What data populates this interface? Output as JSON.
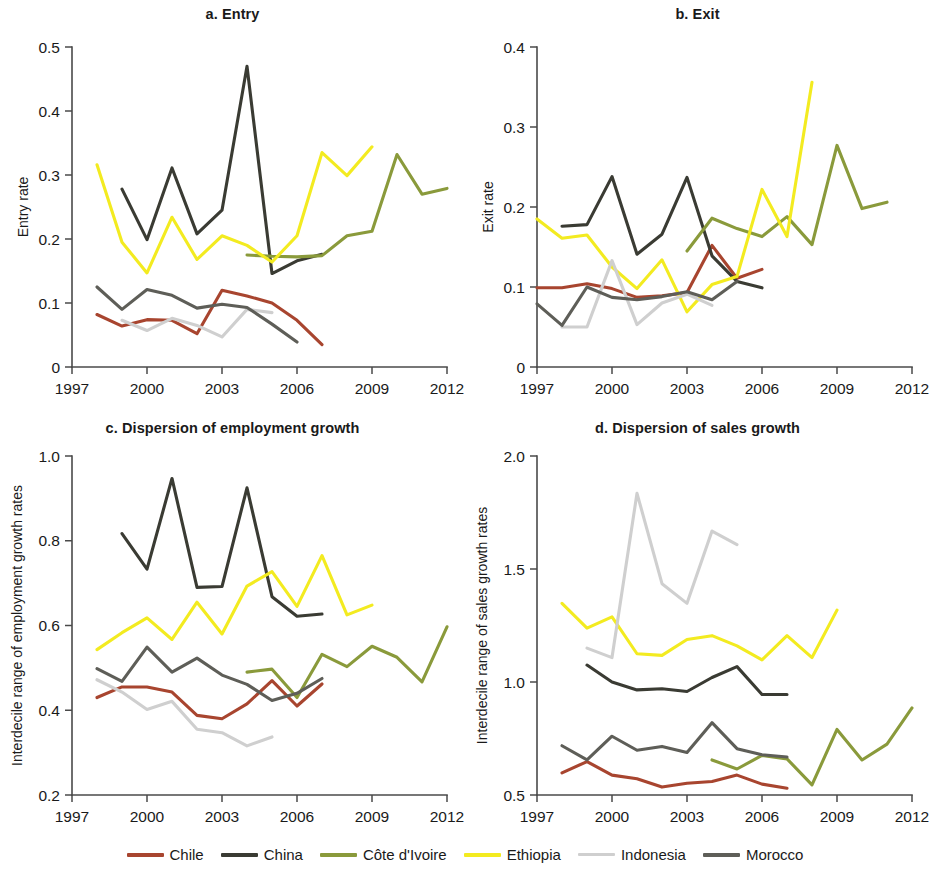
{
  "figure": {
    "title": "",
    "background": "#ffffff"
  },
  "legend": {
    "position": "bottom-center",
    "entries": [
      {
        "label": "Chile",
        "color": "#A8452F"
      },
      {
        "label": "China",
        "color": "#3A3B33"
      },
      {
        "label": "Côte d'Ivoire",
        "color": "#8A9A3B"
      },
      {
        "label": "Ethiopia",
        "color": "#F3EB20"
      },
      {
        "label": "Indonesia",
        "color": "#CFCFCF"
      },
      {
        "label": "Morocco",
        "color": "#5E5E58"
      }
    ]
  },
  "panels": [
    {
      "key": "a",
      "title": "a. Entry",
      "ylabel": "Entry rate"
    },
    {
      "key": "b",
      "title": "b. Exit",
      "ylabel": "Exit rate"
    },
    {
      "key": "c",
      "title": "c. Dispersion of employment growth",
      "ylabel": "Interdecile range of employment growth rates"
    },
    {
      "key": "d",
      "title": "d. Dispersion of sales growth",
      "ylabel": "Interdecile range of sales growth rates"
    }
  ],
  "chart_data": [
    {
      "type": "line",
      "panel": "a",
      "title": "a. Entry",
      "xlabel": "",
      "ylabel": "Entry rate",
      "xlim": [
        1997,
        2012
      ],
      "ylim": [
        0,
        0.5
      ],
      "xticks": [
        1997,
        2000,
        2003,
        2006,
        2009,
        2012
      ],
      "yticks": [
        0,
        0.1,
        0.2,
        0.3,
        0.4,
        0.5
      ],
      "ytick_labels": [
        "0",
        "0.1",
        "0.2",
        "0.3",
        "0.4",
        "0.5"
      ],
      "grid": false,
      "legend_position": "bottom",
      "series": [
        {
          "name": "Chile",
          "color": "#A8452F",
          "x": [
            1998,
            1999,
            2000,
            2001,
            2002,
            2003,
            2004,
            2005,
            2006,
            2007
          ],
          "values": [
            0.082,
            0.064,
            0.074,
            0.073,
            0.052,
            0.12,
            0.111,
            0.1,
            0.073,
            0.035
          ]
        },
        {
          "name": "China",
          "color": "#3A3B33",
          "x": [
            1999,
            2000,
            2001,
            2002,
            2003,
            2004,
            2005,
            2006,
            2007
          ],
          "values": [
            0.278,
            0.199,
            0.311,
            0.208,
            0.245,
            0.47,
            0.146,
            0.166,
            0.176
          ]
        },
        {
          "name": "Côte d'Ivoire",
          "color": "#8A9A3B",
          "x": [
            2004,
            2005,
            2006,
            2007,
            2008,
            2009,
            2010,
            2011,
            2012
          ],
          "values": [
            0.175,
            0.173,
            0.172,
            0.174,
            0.205,
            0.212,
            0.332,
            0.27,
            0.279
          ]
        },
        {
          "name": "Ethiopia",
          "color": "#F3EB20",
          "x": [
            1998,
            1999,
            2000,
            2001,
            2002,
            2003,
            2004,
            2005,
            2006,
            2007,
            2008,
            2009
          ],
          "values": [
            0.316,
            0.195,
            0.147,
            0.234,
            0.168,
            0.205,
            0.19,
            0.164,
            0.205,
            0.335,
            0.299,
            0.344
          ]
        },
        {
          "name": "Indonesia",
          "color": "#CFCFCF",
          "x": [
            1999,
            2000,
            2001,
            2002,
            2003,
            2004,
            2005
          ],
          "values": [
            0.073,
            0.057,
            0.076,
            0.065,
            0.047,
            0.09,
            0.085
          ]
        },
        {
          "name": "Morocco",
          "color": "#5E5E58",
          "x": [
            1998,
            1999,
            2000,
            2001,
            2002,
            2003,
            2004,
            2005,
            2006
          ],
          "values": [
            0.125,
            0.09,
            0.121,
            0.112,
            0.092,
            0.098,
            0.093,
            0.067,
            0.039
          ]
        }
      ]
    },
    {
      "type": "line",
      "panel": "b",
      "title": "b. Exit",
      "xlabel": "",
      "ylabel": "Exit rate",
      "xlim": [
        1997,
        2012
      ],
      "ylim": [
        0,
        0.4
      ],
      "xticks": [
        1997,
        2000,
        2003,
        2006,
        2009,
        2012
      ],
      "yticks": [
        0,
        0.1,
        0.2,
        0.3,
        0.4
      ],
      "ytick_labels": [
        "0",
        "0.1",
        "0.2",
        "0.3",
        "0.4"
      ],
      "grid": false,
      "legend_position": "bottom",
      "series": [
        {
          "name": "Chile",
          "color": "#A8452F",
          "x": [
            1997,
            1998,
            1999,
            2000,
            2001,
            2002,
            2003,
            2004,
            2005,
            2006
          ],
          "values": [
            0.099,
            0.099,
            0.104,
            0.098,
            0.087,
            0.089,
            0.093,
            0.152,
            0.111,
            0.122
          ]
        },
        {
          "name": "China",
          "color": "#3A3B33",
          "x": [
            1998,
            1999,
            2000,
            2001,
            2002,
            2003,
            2004,
            2005,
            2006
          ],
          "values": [
            0.176,
            0.178,
            0.238,
            0.141,
            0.166,
            0.237,
            0.139,
            0.107,
            0.099
          ]
        },
        {
          "name": "Côte d'Ivoire",
          "color": "#8A9A3B",
          "x": [
            2003,
            2004,
            2005,
            2006,
            2007,
            2008,
            2009,
            2010,
            2011
          ],
          "values": [
            0.145,
            0.186,
            0.173,
            0.163,
            0.188,
            0.153,
            0.277,
            0.198,
            0.206
          ]
        },
        {
          "name": "Ethiopia",
          "color": "#F3EB20",
          "x": [
            1997,
            1998,
            1999,
            2000,
            2001,
            2002,
            2003,
            2004,
            2005,
            2006,
            2007,
            2008
          ],
          "values": [
            0.185,
            0.161,
            0.165,
            0.125,
            0.098,
            0.134,
            0.069,
            0.103,
            0.113,
            0.222,
            0.163,
            0.356
          ]
        },
        {
          "name": "Indonesia",
          "color": "#CFCFCF",
          "x": [
            1998,
            1999,
            2000,
            2001,
            2002,
            2003,
            2004
          ],
          "values": [
            0.05,
            0.05,
            0.133,
            0.053,
            0.08,
            0.091,
            0.077
          ]
        },
        {
          "name": "Morocco",
          "color": "#5E5E58",
          "x": [
            1997,
            1998,
            1999,
            2000,
            2001,
            2002,
            2003,
            2004,
            2005
          ],
          "values": [
            0.079,
            0.052,
            0.1,
            0.087,
            0.084,
            0.088,
            0.094,
            0.084,
            0.107
          ]
        }
      ]
    },
    {
      "type": "line",
      "panel": "c",
      "title": "c. Dispersion of employment growth",
      "xlabel": "",
      "ylabel": "Interdecile range of employment growth rates",
      "xlim": [
        1997,
        2012
      ],
      "ylim": [
        0.2,
        1.0
      ],
      "xticks": [
        1997,
        2000,
        2003,
        2006,
        2009,
        2012
      ],
      "yticks": [
        0.2,
        0.4,
        0.6,
        0.8,
        1.0
      ],
      "ytick_labels": [
        "0.2",
        "0.4",
        "0.6",
        "0.8",
        "1.0"
      ],
      "grid": false,
      "legend_position": "bottom",
      "series": [
        {
          "name": "Chile",
          "color": "#A8452F",
          "x": [
            1998,
            1999,
            2000,
            2001,
            2002,
            2003,
            2004,
            2005,
            2006,
            2007
          ],
          "values": [
            0.43,
            0.455,
            0.455,
            0.443,
            0.388,
            0.38,
            0.415,
            0.47,
            0.41,
            0.462
          ]
        },
        {
          "name": "China",
          "color": "#3A3B33",
          "x": [
            1999,
            2000,
            2001,
            2002,
            2003,
            2004,
            2005,
            2006,
            2007
          ],
          "values": [
            0.817,
            0.733,
            0.947,
            0.69,
            0.692,
            0.925,
            0.668,
            0.622,
            0.627
          ]
        },
        {
          "name": "Côte d'Ivoire",
          "color": "#8A9A3B",
          "x": [
            2004,
            2005,
            2006,
            2007,
            2008,
            2009,
            2010,
            2011,
            2012
          ],
          "values": [
            0.49,
            0.497,
            0.43,
            0.532,
            0.503,
            0.551,
            0.525,
            0.467,
            0.597
          ]
        },
        {
          "name": "Ethiopia",
          "color": "#F3EB20",
          "x": [
            1998,
            1999,
            2000,
            2001,
            2002,
            2003,
            2004,
            2005,
            2006,
            2007,
            2008,
            2009
          ],
          "values": [
            0.543,
            0.583,
            0.618,
            0.567,
            0.655,
            0.58,
            0.693,
            0.727,
            0.645,
            0.765,
            0.625,
            0.648
          ]
        },
        {
          "name": "Indonesia",
          "color": "#CFCFCF",
          "x": [
            1998,
            1999,
            2000,
            2001,
            2002,
            2003,
            2004,
            2005
          ],
          "values": [
            0.472,
            0.443,
            0.402,
            0.421,
            0.355,
            0.347,
            0.316,
            0.337
          ]
        },
        {
          "name": "Morocco",
          "color": "#5E5E58",
          "x": [
            1998,
            1999,
            2000,
            2001,
            2002,
            2003,
            2004,
            2005,
            2006,
            2007
          ],
          "values": [
            0.498,
            0.468,
            0.549,
            0.49,
            0.523,
            0.483,
            0.461,
            0.423,
            0.44,
            0.475
          ]
        }
      ]
    },
    {
      "type": "line",
      "panel": "d",
      "title": "d. Dispersion of sales growth",
      "xlabel": "",
      "ylabel": "Interdecile range of sales growth rates",
      "xlim": [
        1997,
        2012
      ],
      "ylim": [
        0.5,
        2.0
      ],
      "xticks": [
        1997,
        2000,
        2003,
        2006,
        2009,
        2012
      ],
      "yticks": [
        0.5,
        1.0,
        1.5,
        2.0
      ],
      "ytick_labels": [
        "0.5",
        "1.0",
        "1.5",
        "2.0"
      ],
      "grid": false,
      "legend_position": "bottom",
      "series": [
        {
          "name": "Chile",
          "color": "#A8452F",
          "x": [
            1998,
            1999,
            2000,
            2001,
            2002,
            2003,
            2004,
            2005,
            2006,
            2007
          ],
          "values": [
            0.598,
            0.648,
            0.588,
            0.572,
            0.535,
            0.552,
            0.56,
            0.588,
            0.548,
            0.53
          ]
        },
        {
          "name": "China",
          "color": "#3A3B33",
          "x": [
            1999,
            2000,
            2001,
            2002,
            2003,
            2004,
            2005,
            2006,
            2007
          ],
          "values": [
            1.075,
            1.0,
            0.965,
            0.97,
            0.958,
            1.02,
            1.068,
            0.945,
            0.945
          ]
        },
        {
          "name": "Côte d'Ivoire",
          "color": "#8A9A3B",
          "x": [
            2004,
            2005,
            2006,
            2007,
            2008,
            2009,
            2010,
            2011,
            2012
          ],
          "values": [
            0.655,
            0.615,
            0.675,
            0.66,
            0.545,
            0.79,
            0.655,
            0.725,
            0.885
          ]
        },
        {
          "name": "Ethiopia",
          "color": "#F3EB20",
          "x": [
            1998,
            1999,
            2000,
            2001,
            2002,
            2003,
            2004,
            2005,
            2006,
            2007,
            2008,
            2009
          ],
          "values": [
            1.348,
            1.238,
            1.288,
            1.125,
            1.118,
            1.188,
            1.205,
            1.16,
            1.098,
            1.205,
            1.108,
            1.318
          ]
        },
        {
          "name": "Indonesia",
          "color": "#CFCFCF",
          "x": [
            1999,
            2000,
            2001,
            2002,
            2003,
            2004,
            2005
          ],
          "values": [
            1.15,
            1.108,
            1.835,
            1.435,
            1.348,
            1.668,
            1.608
          ]
        },
        {
          "name": "Morocco",
          "color": "#5E5E58",
          "x": [
            1998,
            1999,
            2000,
            2001,
            2002,
            2003,
            2004,
            2005,
            2006,
            2007
          ],
          "values": [
            0.718,
            0.655,
            0.76,
            0.698,
            0.715,
            0.688,
            0.82,
            0.705,
            0.678,
            0.668
          ]
        }
      ]
    }
  ]
}
